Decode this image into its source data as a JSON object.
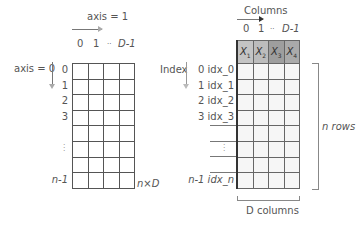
{
  "left": {
    "axis1_label": "axis = 1",
    "axis0_label": "axis = 0",
    "col_labels": [
      "0",
      "1",
      "··",
      "D-1"
    ],
    "row_labels": [
      "0",
      "1",
      "2",
      "3",
      "",
      "⋮",
      "",
      "n-1"
    ],
    "shape_label": "n×D"
  },
  "right": {
    "columns_title": "Columns",
    "index_title": "Index",
    "col_labels": [
      "0",
      "1",
      "··",
      "D-1"
    ],
    "headers": [
      {
        "label": "X",
        "sub": "1",
        "color": "#c4c4c4"
      },
      {
        "label": "X",
        "sub": "2",
        "color": "#bcbcbc"
      },
      {
        "label": "X",
        "sub": "3",
        "color": "#9e9e9e"
      },
      {
        "label": "X",
        "sub": "4",
        "color": "#aaaaaa"
      }
    ],
    "row_labels": [
      "0 idx_0",
      "1 idx_1",
      "2 idx_2",
      "3 idx_3",
      "",
      "⋮",
      "",
      "n-1 idx_n"
    ],
    "rows_bracket_label": "n rows",
    "cols_bracket_label": "D columns"
  }
}
